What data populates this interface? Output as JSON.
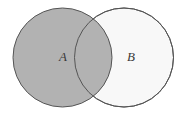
{
  "diagram": {
    "type": "venn-diagram",
    "background_color": "#ffffff",
    "stroke_color": "#555555",
    "stroke_width": 1,
    "canvas": {
      "width": 187,
      "height": 115
    },
    "sets": [
      {
        "id": "A",
        "label": "A",
        "label_x": 63,
        "label_y": 58,
        "center_x": 62.5,
        "center_y": 57.5,
        "radius": 49.5,
        "fill_color": "#b2b2b2",
        "shaded": true
      },
      {
        "id": "B",
        "label": "B",
        "label_x": 131,
        "label_y": 58,
        "center_x": 124,
        "center_y": 57.5,
        "radius": 49.5,
        "fill_color": "#f8f8f8",
        "shaded": false
      }
    ],
    "intersection": {
      "label": "",
      "fill_color": "#b2b2b2",
      "shaded": true
    }
  }
}
